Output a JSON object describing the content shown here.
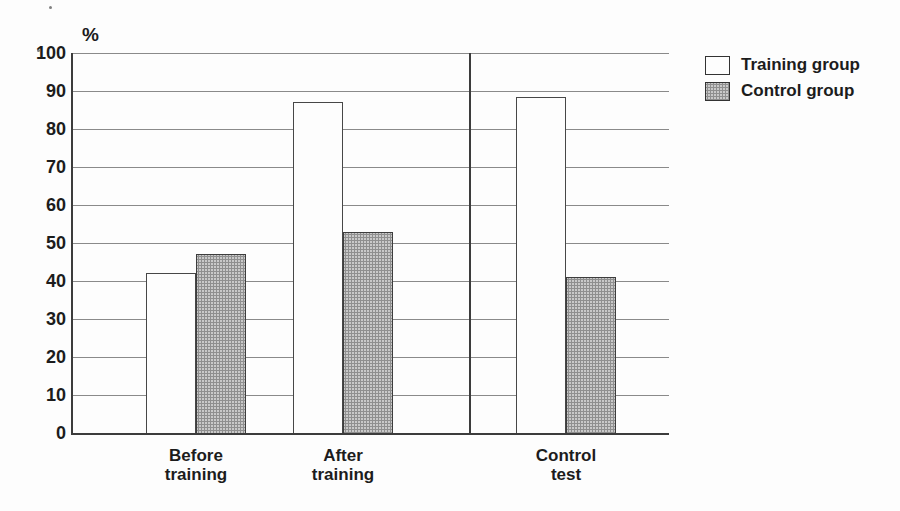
{
  "chart_data": {
    "type": "bar",
    "title": "",
    "ylabel": "%",
    "ylim": [
      0,
      100
    ],
    "yticks": [
      100,
      90,
      80,
      70,
      60,
      50,
      40,
      30,
      20,
      10,
      0
    ],
    "grid": true,
    "categories": [
      "Before training",
      "After training",
      "Control test"
    ],
    "category_label_lines": [
      [
        "Before",
        "training"
      ],
      [
        "After",
        "training"
      ],
      [
        "Control",
        "test"
      ]
    ],
    "series": [
      {
        "name": "Training group",
        "values": [
          42,
          87,
          88.5
        ]
      },
      {
        "name": "Control group",
        "values": [
          47,
          53,
          41
        ]
      }
    ],
    "legend": [
      {
        "label": "Training group",
        "swatch": "white"
      },
      {
        "label": "Control group",
        "swatch": "gray"
      }
    ],
    "legend_position": "top-right",
    "separator_between": [
      "After training",
      "Control test"
    ]
  },
  "colors": {
    "training_fill": "#fdfdfd",
    "control_fill": "#c9c9c9",
    "bar_border": "#3d3d3d",
    "grid_line": "#8a8a8a",
    "axis_line": "#3c3c3c",
    "text": "#1c1c1c"
  }
}
